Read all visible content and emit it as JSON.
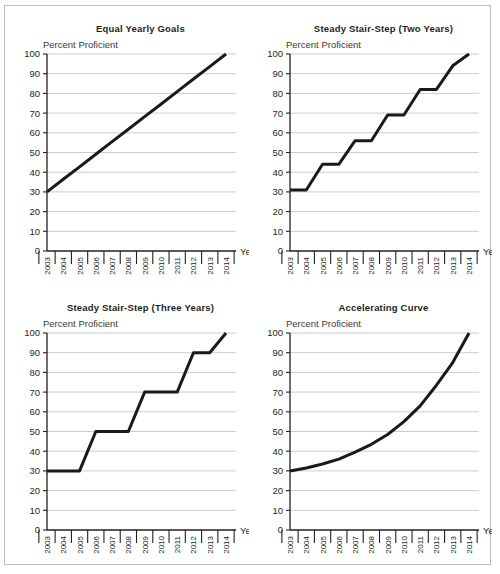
{
  "figure": {
    "y_axis_caption": "Percent Proficient",
    "x_axis_caption": "Year",
    "years": [
      "2003",
      "2004",
      "2005",
      "2006",
      "2007",
      "2008",
      "2009",
      "2010",
      "2011",
      "2012",
      "2013",
      "2014"
    ],
    "y_ticks": [
      "0",
      "10",
      "20",
      "30",
      "40",
      "50",
      "60",
      "70",
      "80",
      "90",
      "100"
    ],
    "line_color": "#1a1a1a",
    "gridline_color": "#c3c6c8",
    "axis_color": "#231f20",
    "frame_color": "#b9bcbe"
  },
  "panels": [
    {
      "key": "equal-yearly-goals",
      "title": "Equal Yearly Goals"
    },
    {
      "key": "steady-stair-step-two-years",
      "title": "Steady Stair-Step (Two Years)"
    },
    {
      "key": "steady-stair-step-three-years",
      "title": "Steady Stair-Step (Three Years)"
    },
    {
      "key": "accelerating-curve",
      "title": "Accelerating Curve"
    }
  ],
  "chart_data": [
    {
      "type": "line",
      "title": "Equal Yearly Goals",
      "xlabel": "Year",
      "ylabel": "Percent Proficient",
      "ylim": [
        0,
        100
      ],
      "ytick_step": 10,
      "grid": true,
      "legend": "none",
      "x": [
        "2003",
        "2004",
        "2005",
        "2006",
        "2007",
        "2008",
        "2009",
        "2010",
        "2011",
        "2012",
        "2013",
        "2014"
      ],
      "values": [
        30,
        36.4,
        42.7,
        49.1,
        55.5,
        61.8,
        68.2,
        74.5,
        80.9,
        87.3,
        93.6,
        100
      ]
    },
    {
      "type": "line",
      "title": "Steady Stair-Step (Two Years)",
      "xlabel": "Year",
      "ylabel": "Percent Proficient",
      "ylim": [
        0,
        100
      ],
      "ytick_step": 10,
      "grid": true,
      "legend": "none",
      "x": [
        "2003",
        "2004",
        "2005",
        "2006",
        "2007",
        "2008",
        "2009",
        "2010",
        "2011",
        "2012",
        "2013",
        "2014"
      ],
      "values": [
        31,
        31,
        44,
        44,
        56,
        56,
        69,
        69,
        82,
        82,
        94,
        100
      ]
    },
    {
      "type": "line",
      "title": "Steady Stair-Step (Three Years)",
      "xlabel": "Year",
      "ylabel": "Percent Proficient",
      "ylim": [
        0,
        100
      ],
      "ytick_step": 10,
      "grid": true,
      "legend": "none",
      "x": [
        "2003",
        "2004",
        "2005",
        "2006",
        "2007",
        "2008",
        "2009",
        "2010",
        "2011",
        "2012",
        "2013",
        "2014"
      ],
      "values": [
        30,
        30,
        30,
        50,
        50,
        50,
        70,
        70,
        70,
        90,
        90,
        100
      ]
    },
    {
      "type": "line",
      "title": "Accelerating Curve",
      "xlabel": "Year",
      "ylabel": "Percent Proficient",
      "ylim": [
        0,
        100
      ],
      "ytick_step": 10,
      "grid": true,
      "legend": "none",
      "x": [
        "2003",
        "2004",
        "2005",
        "2006",
        "2007",
        "2008",
        "2009",
        "2010",
        "2011",
        "2012",
        "2013",
        "2014"
      ],
      "values": [
        30,
        31.5,
        33.5,
        36,
        39.5,
        43.5,
        48.5,
        55,
        63,
        73.5,
        85,
        100
      ]
    }
  ]
}
